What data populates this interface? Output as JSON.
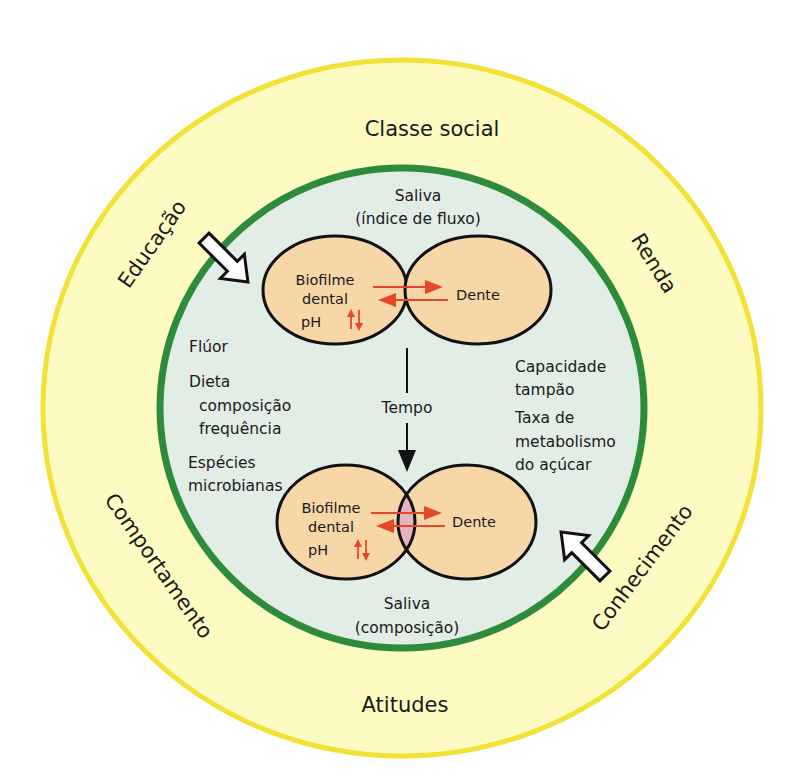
{
  "diagram": {
    "type": "concentric-factors-diagram",
    "colors": {
      "outer_ring_fill": "#fdfbc2",
      "outer_ring_edge": "#f3e136",
      "inner_circle_border": "#2e8b3c",
      "inner_circle_fill": "#e2ede6",
      "ellipse_fill": "#f7d6a8",
      "ellipse_stroke": "#111111",
      "overlap_fill": "#e6b3bf",
      "interaction_arrow": "#e4472a"
    },
    "outer_ring": {
      "top": "Classe social",
      "bottom": "Atitudes",
      "upper_left": "Educação",
      "upper_right": "Renda",
      "lower_left": "Comportamento",
      "lower_right": "Conhecimento"
    },
    "inner_circle": {
      "saliva_top_line1": "Saliva",
      "saliva_top_line2": "(índice de fluxo)",
      "saliva_bottom_line1": "Saliva",
      "saliva_bottom_line2": "(composição)",
      "left_factors": {
        "fluor": "Flúor",
        "dieta": "Dieta",
        "dieta_sub1": "composição",
        "dieta_sub2": "frequência",
        "especies1": "Espécies",
        "especies2": "microbianas"
      },
      "right_factors": {
        "capacidade1": "Capacidade",
        "capacidade2": "tampão",
        "taxa1": "Taxa de",
        "taxa2": "metabolismo",
        "taxa3": "do açúcar"
      },
      "time_label": "Tempo"
    },
    "top_pair": {
      "left_line1": "Biofilme",
      "left_line2": "dental",
      "ph_label": "pH",
      "right_label": "Dente"
    },
    "bottom_pair": {
      "left_line1": "Biofilme",
      "left_line2": "dental",
      "ph_label": "pH",
      "right_label": "Dente"
    }
  }
}
